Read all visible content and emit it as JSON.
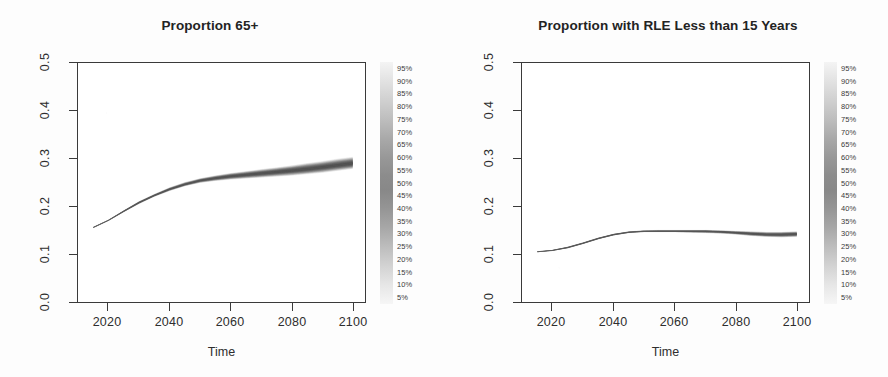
{
  "figure": {
    "background_color": "#fdfdfd",
    "frame_color": "#3a3a3a",
    "panels": 2
  },
  "chart_data": [
    {
      "type": "area",
      "title": "Proportion 65+",
      "xlabel": "Time",
      "ylabel": "",
      "xlim": [
        2010,
        2104
      ],
      "ylim": [
        0.0,
        0.5
      ],
      "grid": false,
      "legend_position": "right",
      "xticks": [
        "2020",
        "2040",
        "2060",
        "2080",
        "2100"
      ],
      "xtick_values": [
        2020,
        2040,
        2060,
        2080,
        2100
      ],
      "yticks": [
        "0.0",
        "0.1",
        "0.2",
        "0.3",
        "0.4",
        "0.5"
      ],
      "ytick_values": [
        0.0,
        0.1,
        0.2,
        0.3,
        0.4,
        0.5
      ],
      "x": [
        2015,
        2020,
        2025,
        2030,
        2035,
        2040,
        2045,
        2050,
        2055,
        2060,
        2065,
        2070,
        2075,
        2080,
        2085,
        2090,
        2095,
        2100
      ],
      "series": [
        {
          "name": "median",
          "values": [
            0.156,
            0.171,
            0.19,
            0.208,
            0.223,
            0.236,
            0.246,
            0.254,
            0.259,
            0.263,
            0.266,
            0.269,
            0.272,
            0.275,
            0.278,
            0.282,
            0.286,
            0.29
          ]
        },
        {
          "name": "lower_5pct",
          "values": [
            0.155,
            0.17,
            0.188,
            0.205,
            0.22,
            0.232,
            0.242,
            0.249,
            0.253,
            0.256,
            0.258,
            0.26,
            0.262,
            0.264,
            0.267,
            0.27,
            0.274,
            0.278
          ]
        },
        {
          "name": "upper_95pct",
          "values": [
            0.157,
            0.172,
            0.192,
            0.211,
            0.226,
            0.24,
            0.251,
            0.259,
            0.265,
            0.27,
            0.274,
            0.278,
            0.282,
            0.286,
            0.291,
            0.295,
            0.3,
            0.304
          ]
        }
      ],
      "legend": {
        "title": "",
        "entries": [
          "95%",
          "90%",
          "85%",
          "80%",
          "75%",
          "70%",
          "65%",
          "60%",
          "55%",
          "50%",
          "45%",
          "40%",
          "35%",
          "30%",
          "25%",
          "20%",
          "15%",
          "10%",
          "5%"
        ]
      }
    },
    {
      "type": "area",
      "title": "Proportion with RLE Less than 15 Years",
      "xlabel": "Time",
      "ylabel": "",
      "xlim": [
        2010,
        2104
      ],
      "ylim": [
        0.0,
        0.5
      ],
      "grid": false,
      "legend_position": "right",
      "xticks": [
        "2020",
        "2040",
        "2060",
        "2080",
        "2100"
      ],
      "xtick_values": [
        2020,
        2040,
        2060,
        2080,
        2100
      ],
      "yticks": [
        "0.0",
        "0.1",
        "0.2",
        "0.3",
        "0.4",
        "0.5"
      ],
      "ytick_values": [
        0.0,
        0.1,
        0.2,
        0.3,
        0.4,
        0.5
      ],
      "x": [
        2015,
        2020,
        2025,
        2030,
        2035,
        2040,
        2045,
        2050,
        2055,
        2060,
        2065,
        2070,
        2075,
        2080,
        2085,
        2090,
        2095,
        2100
      ],
      "series": [
        {
          "name": "median",
          "values": [
            0.105,
            0.108,
            0.114,
            0.123,
            0.133,
            0.141,
            0.146,
            0.148,
            0.148,
            0.148,
            0.148,
            0.148,
            0.147,
            0.145,
            0.143,
            0.141,
            0.141,
            0.142
          ]
        },
        {
          "name": "lower_5pct",
          "values": [
            0.104,
            0.107,
            0.112,
            0.121,
            0.131,
            0.139,
            0.144,
            0.146,
            0.146,
            0.146,
            0.145,
            0.144,
            0.143,
            0.141,
            0.138,
            0.136,
            0.135,
            0.136
          ]
        },
        {
          "name": "upper_95pct",
          "values": [
            0.106,
            0.109,
            0.116,
            0.125,
            0.135,
            0.143,
            0.148,
            0.15,
            0.151,
            0.151,
            0.151,
            0.151,
            0.15,
            0.149,
            0.148,
            0.147,
            0.147,
            0.148
          ]
        }
      ],
      "legend": {
        "title": "",
        "entries": [
          "95%",
          "90%",
          "85%",
          "80%",
          "75%",
          "70%",
          "65%",
          "60%",
          "55%",
          "50%",
          "45%",
          "40%",
          "35%",
          "30%",
          "25%",
          "20%",
          "15%",
          "10%",
          "5%"
        ]
      }
    }
  ]
}
